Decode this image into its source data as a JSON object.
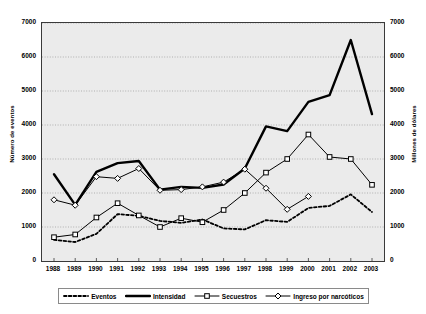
{
  "chart_data": {
    "type": "line",
    "title": "",
    "xlabel": "",
    "ylabel": "Número de eventos",
    "ylabel_right": "Millones de dólares",
    "categories": [
      "1988",
      "1989",
      "1990",
      "1991",
      "1992",
      "1993",
      "1994",
      "1995",
      "1996",
      "1997",
      "1998",
      "1999",
      "2000",
      "2001",
      "2002",
      "2003"
    ],
    "ylim": [
      0,
      7000
    ],
    "ylim_right": [
      0,
      7000
    ],
    "yticks": [
      0,
      1000,
      2000,
      3000,
      4000,
      5000,
      6000,
      7000
    ],
    "yticks_right": [
      0,
      1000,
      2000,
      3000,
      4000,
      5000,
      6000,
      7000
    ],
    "grid": true,
    "legend_position": "bottom",
    "series": [
      {
        "name": "Eventos",
        "axis": "left",
        "style": "dotted",
        "marker": "none",
        "values": [
          620,
          560,
          800,
          1380,
          1330,
          1180,
          1120,
          1220,
          960,
          930,
          1200,
          1150,
          1560,
          1620,
          1960,
          1440
        ]
      },
      {
        "name": "Intensidad",
        "axis": "left",
        "style": "solid-thick",
        "marker": "none",
        "values": [
          2550,
          1650,
          2620,
          2880,
          2940,
          2100,
          2180,
          2150,
          2250,
          2720,
          3960,
          3820,
          4680,
          4880,
          6500,
          4320
        ]
      },
      {
        "name": "Secuestros",
        "axis": "left",
        "style": "solid-thin",
        "marker": "square",
        "values": [
          700,
          780,
          1280,
          1700,
          1340,
          1000,
          1260,
          1140,
          1500,
          2000,
          2600,
          3000,
          3720,
          3060,
          3000,
          2240
        ]
      },
      {
        "name": "Ingreso por narcóticos",
        "axis": "right",
        "style": "solid-thin",
        "marker": "diamond",
        "values": [
          1800,
          1640,
          2480,
          2430,
          2720,
          2080,
          2100,
          2180,
          2320,
          2700,
          2140,
          1520,
          1900,
          null,
          null,
          null
        ]
      }
    ]
  },
  "legend": {
    "items": [
      {
        "label": "Eventos",
        "marker": "dotted-line-swatch"
      },
      {
        "label": "Intensidad",
        "marker": "thick-line-swatch"
      },
      {
        "label": "Secuestros",
        "marker": "square-marker-line-swatch"
      },
      {
        "label": "Ingreso por narcóticos",
        "marker": "diamond-marker-line-swatch"
      }
    ]
  }
}
